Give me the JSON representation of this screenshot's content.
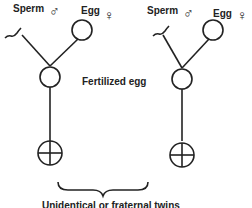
{
  "diagram": {
    "left": {
      "sperm_label": "Sperm",
      "male_symbol": "♂",
      "egg_label": "Egg",
      "female_symbol": "♀"
    },
    "right": {
      "sperm_label": "Sperm",
      "male_symbol": "♂",
      "egg_label": "Egg",
      "female_symbol": "♀"
    },
    "center_label": "Fertilized egg",
    "caption": "Unidentical or fraternal twins"
  }
}
